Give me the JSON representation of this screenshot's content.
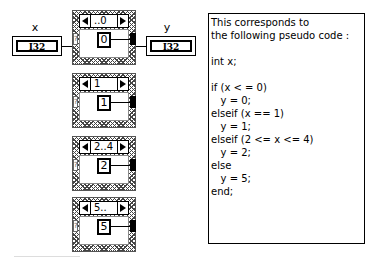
{
  "diagram": {
    "input": {
      "label": "x",
      "type": "I32"
    },
    "output": {
      "label": "y",
      "type": "I32"
    },
    "cases": [
      {
        "selector": "..0",
        "constant": "0"
      },
      {
        "selector": "1",
        "constant": "1"
      },
      {
        "selector": "2..4",
        "constant": "2"
      },
      {
        "selector": "5..",
        "constant": "5"
      }
    ],
    "selector_terminal_glyph": "?"
  },
  "note": {
    "lines": [
      "This corresponds to",
      "the following pseudo code :",
      "",
      "int x;",
      "",
      "if (x < = 0)",
      "   y = 0;",
      "elseif (x == 1)",
      "   y = 1;",
      "elseif (2 <= x <= 4)",
      "   y = 2;",
      "else",
      "   y = 5;",
      "end;"
    ]
  }
}
